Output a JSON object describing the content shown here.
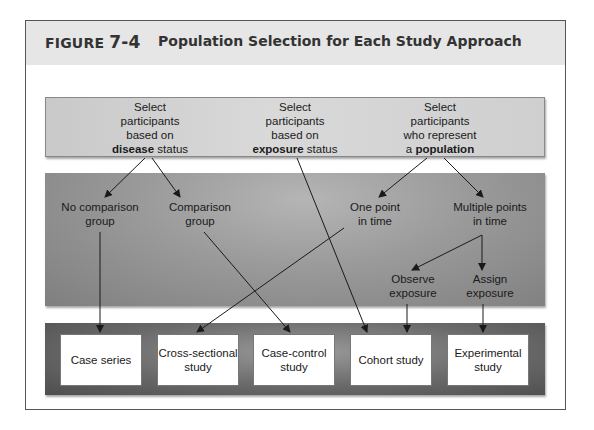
{
  "figure": {
    "label_prefix": "FIGURE ",
    "label_number": "7-4",
    "title": "Population Selection for Each Study Approach"
  },
  "top_row": [
    {
      "line1": "Select",
      "line2": "participants",
      "line3": "based on",
      "bold": "disease",
      "rest": " status"
    },
    {
      "line1": "Select",
      "line2": "participants",
      "line3": "based on",
      "bold": "exposure",
      "rest": " status"
    },
    {
      "line1": "Select",
      "line2": "participants",
      "line3": "who represent",
      "pre": "a ",
      "bold": "population"
    }
  ],
  "middle_row": {
    "no_comparison": {
      "line1": "No comparison",
      "line2": "group"
    },
    "comparison": {
      "line1": "Comparison",
      "line2": "group"
    },
    "one_point": {
      "line1": "One point",
      "line2": "in time"
    },
    "multiple_points": {
      "line1": "Multiple points",
      "line2": "in time"
    },
    "observe": {
      "line1": "Observe",
      "line2": "exposure"
    },
    "assign": {
      "line1": "Assign",
      "line2": "exposure"
    }
  },
  "study_types": [
    {
      "line1": "Case series",
      "line2": ""
    },
    {
      "line1": "Cross-sectional",
      "line2": "study"
    },
    {
      "line1": "Case-control",
      "line2": "study"
    },
    {
      "line1": "Cohort study",
      "line2": ""
    },
    {
      "line1": "Experimental",
      "line2": "study"
    }
  ],
  "colors": {
    "header_bg": "#e6e6e6",
    "top_band": "#d0d0d0",
    "middle_band": "#9a9a9a",
    "bottom_band": "#5a5a5a",
    "arrow": "#1a1a1a"
  }
}
